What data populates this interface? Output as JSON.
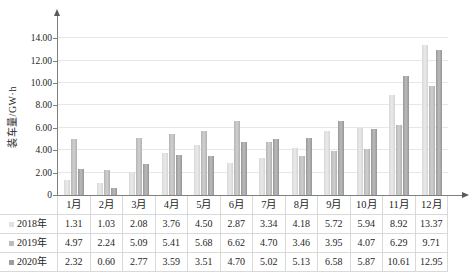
{
  "chart": {
    "y_axis": {
      "label": "装车量/GW·h",
      "tick_labels": [
        "14.00",
        "12.00",
        "10.00",
        "8.00",
        "6.00",
        "4.00",
        "2.00",
        "0"
      ],
      "tick_values": [
        14,
        12,
        10,
        8,
        6,
        4,
        2,
        0
      ]
    },
    "colors": {
      "gridline": "#e7e7e7",
      "axis": "#7f7f7f",
      "table_border": "#d9d9d9",
      "text": "#262626"
    }
  },
  "chart_data": {
    "type": "bar",
    "categories": [
      "1月",
      "2月",
      "3月",
      "4月",
      "5月",
      "6月",
      "7月",
      "8月",
      "9月",
      "10月",
      "11月",
      "12月"
    ],
    "series": [
      {
        "name": "2018年",
        "color": "#e1e1e1",
        "values": [
          1.31,
          1.03,
          2.08,
          3.76,
          4.5,
          2.87,
          3.34,
          4.18,
          5.72,
          5.94,
          8.92,
          13.37
        ]
      },
      {
        "name": "2019年",
        "color": "#bcbcbc",
        "values": [
          4.97,
          2.24,
          5.09,
          5.41,
          5.68,
          6.62,
          4.7,
          3.46,
          3.95,
          4.07,
          6.29,
          9.71
        ]
      },
      {
        "name": "2020年",
        "color": "#9e9e9e",
        "values": [
          2.32,
          0.6,
          2.77,
          3.59,
          3.51,
          4.7,
          5.02,
          5.13,
          6.58,
          5.87,
          10.61,
          12.95
        ]
      }
    ],
    "title": "",
    "xlabel": "",
    "ylabel": "装车量/GW·h",
    "ylim": [
      0,
      14
    ],
    "y_tick_step": 2,
    "grid": true,
    "value_decimals": 2,
    "legend_position": "data-table-left"
  }
}
